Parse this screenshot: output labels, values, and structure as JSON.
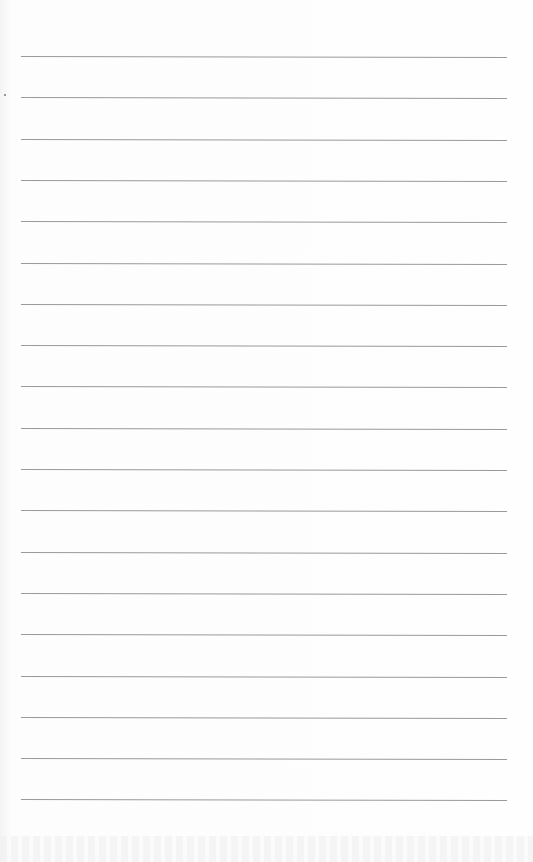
{
  "page": {
    "type": "blank ruled notebook page",
    "background_color": "#fdfdfd",
    "rule_color": "#9a9a9a",
    "rule_count": 19,
    "rule_left_px": 21,
    "rule_width_px": 486,
    "first_rule_y_px": 56,
    "rule_spacing_px": 41.3,
    "text": ""
  }
}
